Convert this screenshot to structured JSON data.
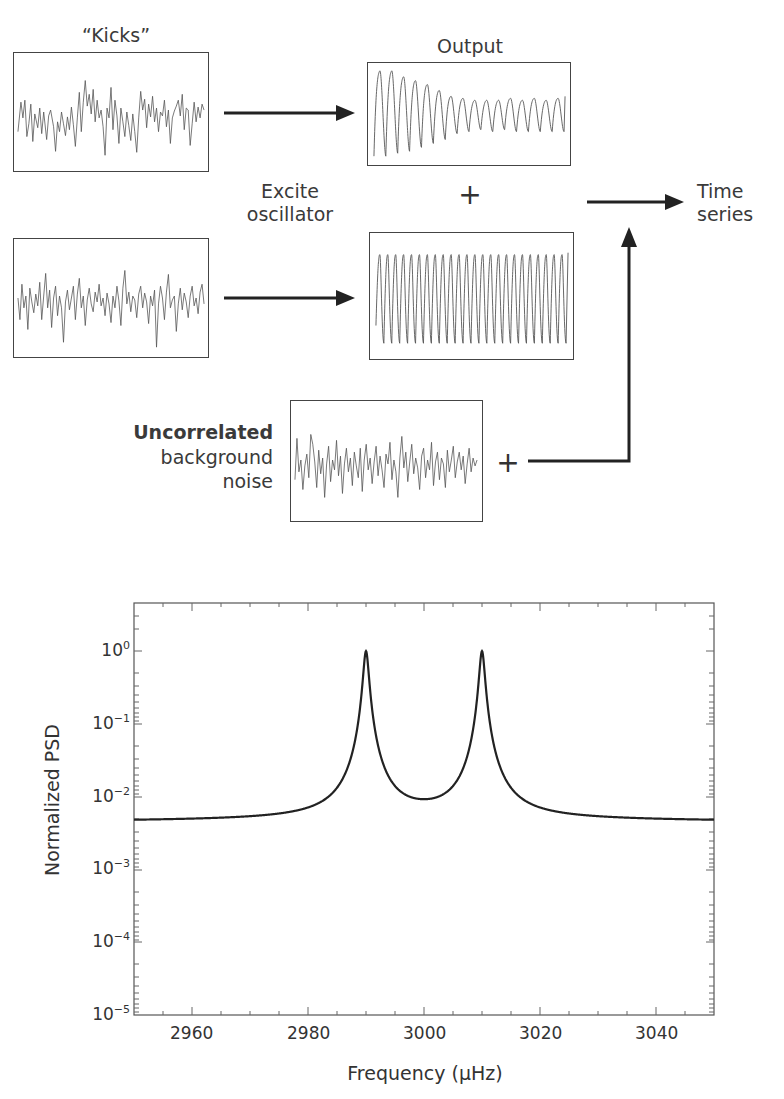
{
  "diagram": {
    "kicks_label": "“Kicks”",
    "output_label": "Output",
    "excite_label_line1": "Excite",
    "excite_label_line2": "oscillator",
    "plus_symbol": "+",
    "time_series_line1": "Time",
    "time_series_line2": "series",
    "noise_label_bold": "Uncorrelated",
    "noise_label_line2": "background",
    "noise_label_line3": "noise",
    "panels": [
      {
        "name": "kicks-panel-1",
        "content": "random noise signal"
      },
      {
        "name": "kicks-panel-2",
        "content": "random noise signal"
      },
      {
        "name": "output-damped",
        "content": "decaying sinusoid settling to steady oscillation"
      },
      {
        "name": "output-steady",
        "content": "steady sinusoidal oscillation"
      },
      {
        "name": "background-noise",
        "content": "random noise signal"
      }
    ],
    "arrows": [
      {
        "from": "kicks-panel-1",
        "to": "output-damped"
      },
      {
        "from": "kicks-panel-2",
        "to": "output-steady"
      },
      {
        "from": "sum",
        "to": "time-series"
      },
      {
        "from": "background-noise",
        "to": "time-series"
      }
    ]
  },
  "chart_data": {
    "type": "line",
    "title": "",
    "xlabel": "Frequency (μHz)",
    "ylabel": "Normalized PSD",
    "xlim": [
      2950,
      3050
    ],
    "ylim": [
      1e-05,
      4.5
    ],
    "yscale": "log",
    "x_ticks": [
      2960,
      2980,
      3000,
      3020,
      3040
    ],
    "x_tick_labels": [
      "2960",
      "2980",
      "3000",
      "3020",
      "3040"
    ],
    "y_ticks": [
      1e-05,
      0.0001,
      0.001,
      0.01,
      0.1,
      1
    ],
    "y_tick_labels": [
      {
        "base": "10",
        "exp": "−5"
      },
      {
        "base": "10",
        "exp": "−4"
      },
      {
        "base": "10",
        "exp": "−3"
      },
      {
        "base": "10",
        "exp": "−2"
      },
      {
        "base": "10",
        "exp": "−1"
      },
      {
        "base": "10",
        "exp": "0"
      }
    ],
    "grid": false,
    "series": [
      {
        "name": "PSD (two Lorentzian modes + background)",
        "description": "Two Lorentzian peaks centered at 2990 and 3010 μHz with peak value ~1.0, minimum between peaks ~0.0095 at 3000 μHz, flat floor ~0.005 at edges",
        "x": [
          2950,
          2960,
          2970,
          2975,
          2980,
          2984,
          2986,
          2988,
          2989,
          2990,
          2991,
          2992,
          2994,
          2996,
          2998,
          3000,
          3002,
          3004,
          3006,
          3008,
          3009,
          3010,
          3011,
          3012,
          3014,
          3016,
          3020,
          3025,
          3030,
          3040,
          3050
        ],
        "values": [
          0.0052,
          0.0053,
          0.0055,
          0.006,
          0.0075,
          0.012,
          0.02,
          0.05,
          0.15,
          1.0,
          0.15,
          0.05,
          0.022,
          0.0135,
          0.0105,
          0.0095,
          0.0105,
          0.0135,
          0.022,
          0.05,
          0.15,
          1.0,
          0.15,
          0.05,
          0.02,
          0.012,
          0.0075,
          0.006,
          0.0055,
          0.005,
          0.0048
        ]
      }
    ],
    "peaks": [
      {
        "x": 2990,
        "y": 1.0
      },
      {
        "x": 3010,
        "y": 1.0
      }
    ]
  }
}
